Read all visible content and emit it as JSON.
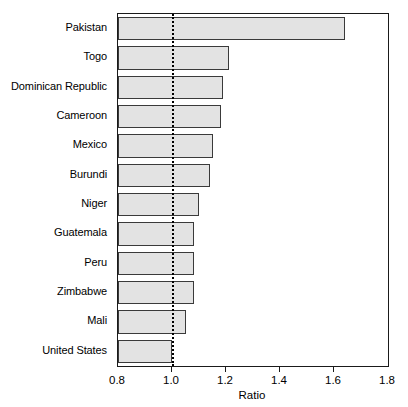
{
  "chart_data": {
    "type": "bar",
    "orientation": "horizontal",
    "title": "",
    "subtitle": "",
    "xlabel": "Ratio",
    "ylabel": "",
    "xlim": [
      0.8,
      1.8
    ],
    "xticks": [
      "0.8",
      "1.0",
      "1.2",
      "1.4",
      "1.6",
      "1.8"
    ],
    "xtick_values": [
      0.8,
      1.0,
      1.2,
      1.4,
      1.6,
      1.8
    ],
    "grid": false,
    "legend": null,
    "reference_line": {
      "value": 1.0,
      "style": "dotted",
      "color": "#000000"
    },
    "bar_style": {
      "fill": "#e3e3e3",
      "edge": "#3a3a3a"
    },
    "categories": [
      "Pakistan",
      "Togo",
      "Dominican Republic",
      "Cameroon",
      "Mexico",
      "Burundi",
      "Niger",
      "Guatemala",
      "Peru",
      "Zimbabwe",
      "Mali",
      "United States"
    ],
    "values": [
      1.64,
      1.21,
      1.19,
      1.18,
      1.15,
      1.14,
      1.1,
      1.08,
      1.08,
      1.08,
      1.05,
      1.0
    ],
    "bars": [
      {
        "category": "Pakistan",
        "value": 1.64
      },
      {
        "category": "Togo",
        "value": 1.21
      },
      {
        "category": "Dominican Republic",
        "value": 1.19
      },
      {
        "category": "Cameroon",
        "value": 1.18
      },
      {
        "category": "Mexico",
        "value": 1.15
      },
      {
        "category": "Burundi",
        "value": 1.14
      },
      {
        "category": "Niger",
        "value": 1.1
      },
      {
        "category": "Guatemala",
        "value": 1.08
      },
      {
        "category": "Peru",
        "value": 1.08
      },
      {
        "category": "Zimbabwe",
        "value": 1.08
      },
      {
        "category": "Mali",
        "value": 1.05
      },
      {
        "category": "United States",
        "value": 1.0
      }
    ]
  }
}
